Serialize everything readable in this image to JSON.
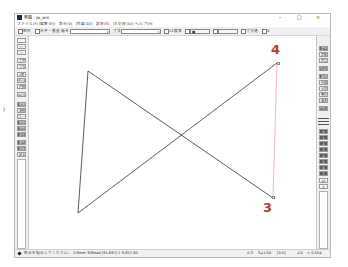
{
  "window": {
    "title": "無題 - jw_win",
    "controls": {
      "minimize": "–",
      "maximize": "□",
      "close": "×"
    }
  },
  "menu": {
    "items": [
      {
        "label": "ファイル(F)"
      },
      {
        "label": "[編集(E)]"
      },
      {
        "label": "表示(V)"
      },
      {
        "label": "[作図(D)]"
      },
      {
        "label": "設定(S)"
      },
      {
        "label": "[その他(A)]"
      },
      {
        "label": "ヘルプ(H)"
      }
    ]
  },
  "toolbar": {
    "rect_label": "矩形",
    "horizontal_vertical_label": "水平・垂直",
    "slope_label": "傾き",
    "slope_value": "",
    "dimension_label": "寸法",
    "dimension_value": "",
    "extend_label": "15度毎",
    "button1_label": "■",
    "button2_label": "",
    "hide_label": "寸法値",
    "x_label": "X"
  },
  "left_toolbox": {
    "items": [
      {
        "label": "／",
        "style": "light",
        "icon": "line-tool-icon"
      },
      {
        "label": "□",
        "style": "light",
        "icon": "rectangle-tool-icon"
      },
      {
        "label": "○",
        "style": "light",
        "icon": "circle-tool-icon"
      },
      {
        "label": "文字",
        "style": "light"
      },
      {
        "label": "寸法",
        "style": "light"
      },
      {
        "label": "2線",
        "style": "light"
      },
      {
        "label": "中心線",
        "style": "light"
      },
      {
        "label": "連線",
        "style": "light"
      },
      {
        "label": "AUTO",
        "style": "light"
      },
      {
        "label": "範囲",
        "style": "dark"
      },
      {
        "label": "複線",
        "style": "light"
      },
      {
        "label": "コーナー",
        "style": "light"
      },
      {
        "label": "伸縮",
        "style": "dark"
      },
      {
        "label": "面取",
        "style": "dark"
      },
      {
        "label": "消去",
        "style": "dark"
      },
      {
        "label": "複写",
        "style": "dark"
      },
      {
        "label": "移動",
        "style": "dark"
      },
      {
        "label": "戻る",
        "style": "light"
      }
    ]
  },
  "right_toolbox": {
    "items": [
      {
        "label": "建平",
        "style": "dark"
      },
      {
        "label": "建断",
        "style": "light"
      },
      {
        "label": "建立",
        "style": "light"
      },
      {
        "label": "多角形",
        "style": "dark"
      },
      {
        "label": "曲線",
        "style": "dark"
      },
      {
        "label": "包絡",
        "style": "light"
      },
      {
        "label": "分割",
        "style": "light"
      },
      {
        "label": "整理",
        "style": "light"
      },
      {
        "label": "属変",
        "style": "light"
      },
      {
        "label": "BL化",
        "style": "blue"
      }
    ],
    "layers": [
      "0",
      "1",
      "2",
      "3",
      "4",
      "5",
      "6",
      "7"
    ],
    "all_label": "All",
    "extra_label": "0"
  },
  "canvas": {
    "shape": "bowtie",
    "points": {
      "left_top": [
        87,
        70
      ],
      "left_bottom": [
        77,
        212
      ],
      "right_top": [
        276,
        62
      ],
      "right_bottom": [
        272,
        197
      ]
    },
    "line_color": "#333333",
    "highlight_color": "#e8a0a0",
    "annotations": [
      {
        "label": "4",
        "x": 270,
        "y": 42
      },
      {
        "label": "3",
        "x": 262,
        "y": 200
      }
    ],
    "annotation_color": "#c0392b"
  },
  "statusbar": {
    "message": "終点を指示してください。 0.8mm 30Read [81.667] 1 9,857.65",
    "paper": "A-3",
    "scale": "S=1/50",
    "layer": "[0-0]",
    "angle": "∠0",
    "zoom": "× 0.554"
  }
}
